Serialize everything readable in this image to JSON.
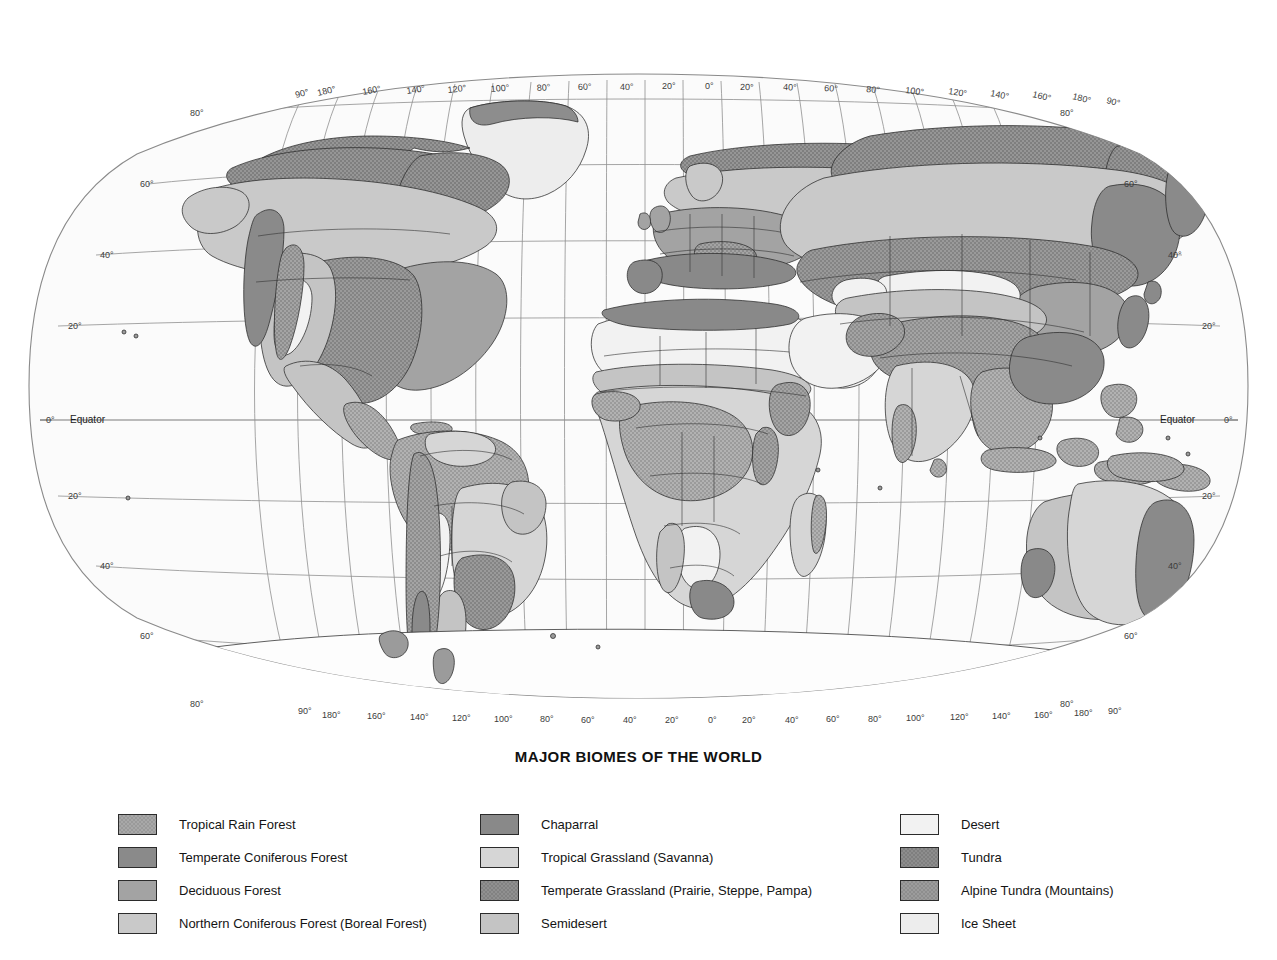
{
  "title": "MAJOR BIOMES OF THE WORLD",
  "projection": "Robinson-style oval world projection",
  "graticule": {
    "equator_label": "Equator",
    "pole_label": "90°",
    "top_longitude_labels": [
      "180°",
      "160°",
      "140°",
      "120°",
      "100°",
      "80°",
      "60°",
      "40°",
      "20°",
      "0°",
      "20°",
      "40°",
      "60°",
      "80°",
      "100°",
      "120°",
      "140°",
      "160°",
      "180°"
    ],
    "bottom_longitude_labels": [
      "180°",
      "160°",
      "140°",
      "120°",
      "100°",
      "80°",
      "60°",
      "40°",
      "20°",
      "0°",
      "20°",
      "40°",
      "60°",
      "80°",
      "100°",
      "120°",
      "140°",
      "160°",
      "180°"
    ],
    "left_latitude_labels": [
      "80°",
      "60°",
      "40°",
      "20°",
      "0°",
      "20°",
      "40°",
      "60°",
      "80°"
    ],
    "right_latitude_labels": [
      "80°",
      "60°",
      "40°",
      "20°",
      "0°",
      "20°",
      "40°",
      "60°",
      "80°"
    ],
    "latitude_values": [
      80,
      60,
      40,
      20,
      0,
      -20,
      -40,
      -60,
      -80
    ],
    "longitude_values": [
      -180,
      -160,
      -140,
      -120,
      -100,
      -80,
      -60,
      -40,
      -20,
      0,
      20,
      40,
      60,
      80,
      100,
      120,
      140,
      160,
      180
    ],
    "longitude_interval_degrees": 20,
    "latitude_interval_degrees": 20
  },
  "legend": {
    "columns": [
      {
        "items": [
          {
            "label": "Tropical Rain Forest",
            "color": "#a8a8a8",
            "pattern": "stipple"
          },
          {
            "label": "Temperate Coniferous Forest",
            "color": "#8a8a8a",
            "pattern": "solid"
          },
          {
            "label": "Deciduous Forest",
            "color": "#a3a3a3",
            "pattern": "solid"
          },
          {
            "label": "Northern Coniferous Forest (Boreal Forest)",
            "color": "#c9c9c9",
            "pattern": "solid"
          }
        ]
      },
      {
        "items": [
          {
            "label": "Chaparral",
            "color": "#898989",
            "pattern": "solid"
          },
          {
            "label": "Tropical Grassland (Savanna)",
            "color": "#d6d6d6",
            "pattern": "solid"
          },
          {
            "label": "Temperate Grassland (Prairie, Steppe, Pampa)",
            "color": "#909090",
            "pattern": "stipple"
          },
          {
            "label": "Semidesert",
            "color": "#c4c4c4",
            "pattern": "solid"
          }
        ]
      },
      {
        "items": [
          {
            "label": "Desert",
            "color": "#f2f2f2",
            "pattern": "solid"
          },
          {
            "label": "Tundra",
            "color": "#8d8d8d",
            "pattern": "stipple"
          },
          {
            "label": "Alpine Tundra (Mountains)",
            "color": "#9c9c9c",
            "pattern": "stipple"
          },
          {
            "label": "Ice Sheet",
            "color": "#ededed",
            "pattern": "solid"
          }
        ]
      }
    ]
  },
  "map_colors": {
    "ocean": "#fbfbfb",
    "graticule": "#8f8f8f",
    "outline": "#8a8a8a",
    "coastline": "#2a2a2a",
    "country_border": "#333333",
    "tropical_rain_forest": "#a8a8a8",
    "temperate_coniferous_forest": "#8a8a8a",
    "deciduous_forest": "#a3a3a3",
    "boreal_forest": "#c9c9c9",
    "chaparral": "#898989",
    "savanna": "#d6d6d6",
    "temperate_grassland": "#909090",
    "semidesert": "#c4c4c4",
    "desert": "#f2f2f2",
    "tundra": "#8d8d8d",
    "alpine_tundra": "#9c9c9c",
    "ice_sheet": "#ededed"
  }
}
